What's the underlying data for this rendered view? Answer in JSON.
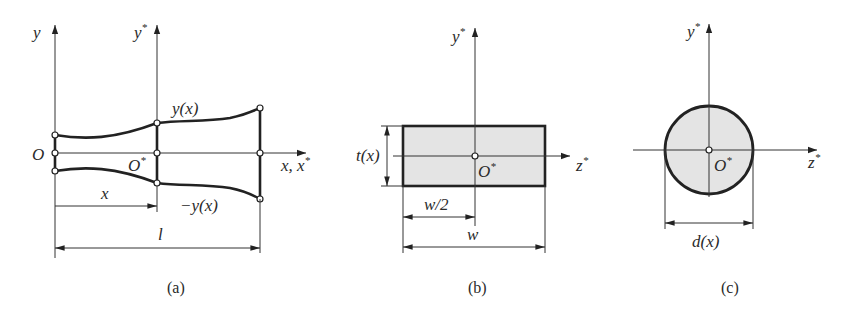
{
  "figure": {
    "panels": [
      {
        "id": "a",
        "caption": "(a)",
        "description": "Side view of a tapered beam symmetric about the x axis",
        "labels": {
          "y_axis": "y",
          "y_star_axis": "y",
          "y_star_sup": "*",
          "origin": "O",
          "local_origin": "O",
          "local_origin_sup": "*",
          "x_axis": "x, x",
          "x_axis_sup": "*",
          "upper_profile": "y(x)",
          "lower_profile": "−y(x)",
          "position_dim": "x",
          "length_dim": "l"
        }
      },
      {
        "id": "b",
        "caption": "(b)",
        "description": "Rectangular cross-section",
        "labels": {
          "y_axis": "y",
          "y_axis_sup": "*",
          "z_axis": "z",
          "z_axis_sup": "*",
          "centroid": "O",
          "centroid_sup": "*",
          "thickness_dim": "t(x)",
          "half_width_dim": "w/2",
          "width_dim": "w"
        }
      },
      {
        "id": "c",
        "caption": "(c)",
        "description": "Circular cross-section",
        "labels": {
          "y_axis": "y",
          "y_axis_sup": "*",
          "z_axis": "z",
          "z_axis_sup": "*",
          "centroid": "O",
          "centroid_sup": "*",
          "diameter_dim": "d(x)"
        }
      }
    ],
    "colors": {
      "ink": "#222222",
      "section_fill": "#e4e4e4",
      "background": "#ffffff"
    }
  }
}
